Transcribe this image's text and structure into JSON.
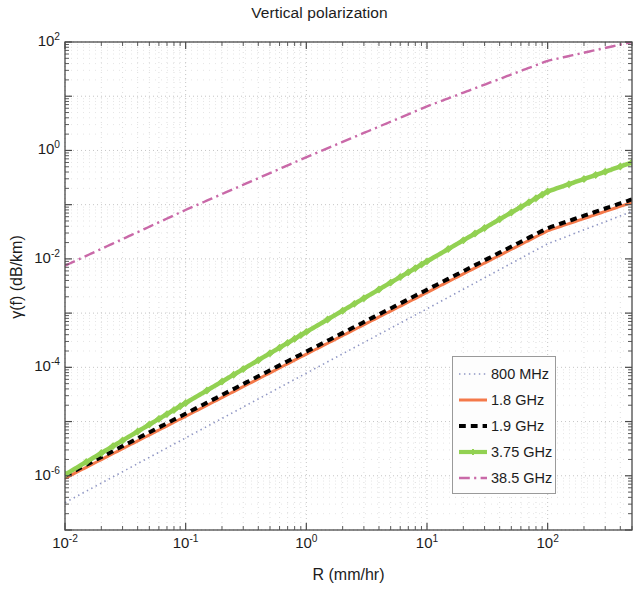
{
  "chart_data": {
    "type": "line",
    "title": "Vertical polarization",
    "xlabel": "R (mm/hr)",
    "ylabel": "γ(f) (dB/km)",
    "xscale": "log",
    "yscale": "log",
    "xlim": [
      0.01,
      500
    ],
    "ylim": [
      1e-07,
      100
    ],
    "grid": true,
    "grid_minor": true,
    "legend_position": "lower right",
    "xticks": [
      {
        "value": 0.01,
        "label_mantissa": "10",
        "label_exp": "-2"
      },
      {
        "value": 0.1,
        "label_mantissa": "10",
        "label_exp": "-1"
      },
      {
        "value": 1,
        "label_mantissa": "10",
        "label_exp": "0"
      },
      {
        "value": 10,
        "label_mantissa": "10",
        "label_exp": "1"
      },
      {
        "value": 100,
        "label_mantissa": "10",
        "label_exp": "2"
      }
    ],
    "yticks": [
      {
        "value": 100,
        "label_mantissa": "10",
        "label_exp": "2"
      },
      {
        "value": 1,
        "label_mantissa": "10",
        "label_exp": "0"
      },
      {
        "value": 0.01,
        "label_mantissa": "10",
        "label_exp": "-2"
      },
      {
        "value": 0.0001,
        "label_mantissa": "10",
        "label_exp": "-4"
      },
      {
        "value": 1e-06,
        "label_mantissa": "10",
        "label_exp": "-6"
      }
    ],
    "series": [
      {
        "name": "800 MHz",
        "color": "#8f96c4",
        "style": "dotted",
        "width": 1.6,
        "marker": "none",
        "x": [
          0.01,
          0.1,
          1,
          10,
          100,
          500
        ],
        "y": [
          3.2e-07,
          5e-06,
          7.8e-05,
          0.0012,
          0.019,
          0.075
        ]
      },
      {
        "name": "1.8 GHz",
        "color": "#f4794a",
        "style": "solid",
        "width": 3.0,
        "marker": "none",
        "x": [
          0.01,
          0.1,
          1,
          10,
          100,
          500
        ],
        "y": [
          9e-07,
          1.25e-05,
          0.000175,
          0.0024,
          0.033,
          0.11
        ]
      },
      {
        "name": "1.9 GHz",
        "color": "#000000",
        "style": "dashed",
        "width": 4.0,
        "marker": "none",
        "x": [
          0.01,
          0.1,
          1,
          10,
          100,
          500
        ],
        "y": [
          1e-06,
          1.4e-05,
          0.000195,
          0.0027,
          0.037,
          0.125
        ]
      },
      {
        "name": "3.75 GHz",
        "color": "#92d152",
        "style": "solid",
        "width": 4.5,
        "marker": "diamond",
        "x": [
          0.01,
          0.1,
          1,
          10,
          100,
          500
        ],
        "y": [
          1.05e-06,
          2.2e-05,
          0.00045,
          0.009,
          0.175,
          0.6
        ]
      },
      {
        "name": "38.5 GHz",
        "color": "#c969a8",
        "style": "dashdot",
        "width": 2.4,
        "marker": "none",
        "x": [
          0.01,
          0.1,
          1,
          10,
          100,
          500
        ],
        "y": [
          0.0075,
          0.08,
          0.75,
          6.5,
          45.0,
          100.0
        ]
      }
    ]
  },
  "legend": {
    "entries": [
      {
        "label": "800 MHz"
      },
      {
        "label": "1.8 GHz"
      },
      {
        "label": "1.9 GHz"
      },
      {
        "label": "3.75 GHz"
      },
      {
        "label": "38.5 GHz"
      }
    ]
  }
}
